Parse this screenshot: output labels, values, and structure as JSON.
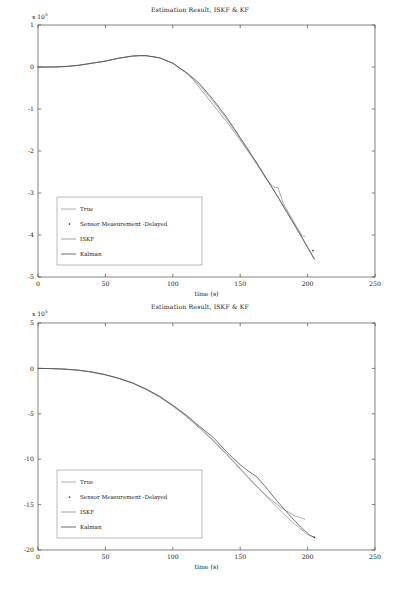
{
  "figure": {
    "background": "#ffffff",
    "axis_color": "#4d4d4d",
    "text_color": "#161616"
  },
  "panels": [
    {
      "id": "panel-top",
      "title": "Estimation Result, ISKF & KF",
      "exponent_prefix": "x 10",
      "exponent_power": "5",
      "xlabel": "time (s)",
      "ylabel": "",
      "xticks": [
        "0",
        "50",
        "100",
        "150",
        "200",
        "250"
      ],
      "yticks": [
        "1",
        "0",
        "-1",
        "-2",
        "-3",
        "-4",
        "-5"
      ],
      "legend": [
        {
          "label": "True",
          "marker": "line",
          "color": "#9a9a9a"
        },
        {
          "label": "Sensor Measurement -Delayed",
          "marker": "dot",
          "color": "#2e2e2e"
        },
        {
          "label": "ISKF",
          "marker": "line",
          "color": "#8c8c8c"
        },
        {
          "label": "Kalman",
          "marker": "line",
          "color": "#4a4a4a"
        }
      ]
    },
    {
      "id": "panel-bottom",
      "title": "Estimation Result, ISKF & KF",
      "exponent_prefix": "x 10",
      "exponent_power": "5",
      "xlabel": "time (s)",
      "ylabel": "",
      "xticks": [
        "0",
        "50",
        "100",
        "150",
        "200",
        "250"
      ],
      "yticks": [
        "5",
        "0",
        "-5",
        "-10",
        "-15",
        "-20"
      ],
      "legend": [
        {
          "label": "True",
          "marker": "line",
          "color": "#9a9a9a"
        },
        {
          "label": "Sensor Measurement -Delayed",
          "marker": "dot",
          "color": "#2e2e2e"
        },
        {
          "label": "ISKF",
          "marker": "line",
          "color": "#8c8c8c"
        },
        {
          "label": "Kalman",
          "marker": "line",
          "color": "#4a4a4a"
        }
      ]
    }
  ],
  "chart_data": [
    {
      "type": "line",
      "title": "Estimation Result, ISKF & KF",
      "xlabel": "time (s)",
      "ylabel": "",
      "y_scale_exponent": 5,
      "xlim": [
        0,
        250
      ],
      "ylim": [
        -5,
        1
      ],
      "xticks": [
        0,
        50,
        100,
        150,
        200,
        250
      ],
      "yticks": [
        1,
        0,
        -1,
        -2,
        -3,
        -4,
        -5
      ],
      "grid": false,
      "legend_position": "lower-left",
      "series": [
        {
          "name": "True",
          "color": "#9a9a9a",
          "x": [
            0,
            10,
            20,
            30,
            40,
            50,
            60,
            70,
            75,
            80,
            90,
            100,
            110,
            115,
            120,
            130,
            140,
            150,
            160,
            170,
            178,
            185,
            195,
            200,
            205
          ],
          "values": [
            0.0,
            0.0,
            0.01,
            0.04,
            0.09,
            0.14,
            0.21,
            0.26,
            0.27,
            0.27,
            0.22,
            0.09,
            -0.14,
            -0.28,
            -0.44,
            -0.82,
            -1.24,
            -1.7,
            -2.18,
            -2.69,
            -3.09,
            -3.46,
            -4.0,
            -4.28,
            -4.56
          ]
        },
        {
          "name": "ISKF",
          "color": "#8c8c8c",
          "x": [
            0,
            10,
            20,
            30,
            40,
            50,
            60,
            70,
            75,
            80,
            90,
            100,
            110,
            115,
            120,
            130,
            140,
            150,
            160,
            170,
            175,
            178,
            182,
            190,
            196,
            198
          ],
          "values": [
            0.0,
            0.0,
            0.01,
            0.04,
            0.09,
            0.14,
            0.21,
            0.26,
            0.27,
            0.27,
            0.22,
            0.09,
            -0.14,
            -0.3,
            -0.5,
            -0.9,
            -1.3,
            -1.74,
            -2.2,
            -2.7,
            -2.86,
            -2.87,
            -3.25,
            -3.7,
            -4.02,
            -4.03
          ]
        },
        {
          "name": "Kalman",
          "color": "#4a4a4a",
          "x": [
            0,
            10,
            20,
            30,
            40,
            50,
            60,
            70,
            75,
            80,
            90,
            100,
            110,
            115,
            120,
            130,
            140,
            150,
            160,
            170,
            178,
            185,
            195,
            200,
            205
          ],
          "values": [
            0.0,
            0.0,
            0.01,
            0.04,
            0.09,
            0.14,
            0.21,
            0.26,
            0.27,
            0.27,
            0.22,
            0.09,
            -0.13,
            -0.26,
            -0.4,
            -0.78,
            -1.2,
            -1.68,
            -2.17,
            -2.68,
            -3.1,
            -3.48,
            -4.02,
            -4.3,
            -4.58
          ]
        },
        {
          "name": "Sensor Measurement -Delayed",
          "color": "#2e2e2e",
          "marker": "dot",
          "x": [
            204
          ],
          "values": [
            -4.37
          ]
        }
      ]
    },
    {
      "type": "line",
      "title": "Estimation Result, ISKF & KF",
      "xlabel": "time (s)",
      "ylabel": "",
      "y_scale_exponent": 5,
      "xlim": [
        0,
        250
      ],
      "ylim": [
        -20,
        5
      ],
      "xticks": [
        0,
        50,
        100,
        150,
        200,
        250
      ],
      "yticks": [
        5,
        0,
        -5,
        -10,
        -15,
        -20
      ],
      "grid": false,
      "legend_position": "lower-left",
      "series": [
        {
          "name": "True",
          "color": "#9a9a9a",
          "x": [
            0,
            10,
            20,
            30,
            40,
            50,
            60,
            70,
            80,
            90,
            100,
            110,
            120,
            130,
            140,
            150,
            160,
            170,
            180,
            190,
            200,
            205
          ],
          "values": [
            0.0,
            -0.02,
            -0.08,
            -0.2,
            -0.4,
            -0.7,
            -1.1,
            -1.6,
            -2.3,
            -3.1,
            -4.1,
            -5.2,
            -6.5,
            -7.9,
            -9.4,
            -11.0,
            -12.6,
            -14.2,
            -15.7,
            -17.1,
            -18.3,
            -18.6
          ]
        },
        {
          "name": "ISKF",
          "color": "#8c8c8c",
          "x": [
            0,
            10,
            20,
            30,
            40,
            50,
            60,
            70,
            80,
            90,
            100,
            110,
            120,
            130,
            140,
            150,
            160,
            170,
            180,
            190,
            198
          ],
          "values": [
            0.0,
            -0.02,
            -0.08,
            -0.2,
            -0.4,
            -0.7,
            -1.1,
            -1.6,
            -2.3,
            -3.15,
            -4.15,
            -5.3,
            -6.6,
            -8.0,
            -9.5,
            -11.1,
            -12.7,
            -14.1,
            -15.3,
            -16.2,
            -16.6
          ]
        },
        {
          "name": "Kalman",
          "color": "#4a4a4a",
          "x": [
            0,
            10,
            20,
            30,
            40,
            50,
            60,
            70,
            80,
            90,
            100,
            110,
            120,
            130,
            140,
            150,
            155,
            162,
            168,
            175,
            182,
            188,
            195,
            202,
            205
          ],
          "values": [
            0.0,
            -0.02,
            -0.08,
            -0.2,
            -0.4,
            -0.7,
            -1.1,
            -1.6,
            -2.25,
            -3.05,
            -4.05,
            -5.15,
            -6.4,
            -7.6,
            -9.2,
            -10.6,
            -11.2,
            -11.9,
            -12.9,
            -14.2,
            -15.4,
            -16.4,
            -17.5,
            -18.4,
            -18.6
          ]
        },
        {
          "name": "Sensor Measurement -Delayed",
          "color": "#2e2e2e",
          "marker": "dot",
          "x": [
            205
          ],
          "values": [
            -18.6
          ]
        }
      ]
    }
  ]
}
